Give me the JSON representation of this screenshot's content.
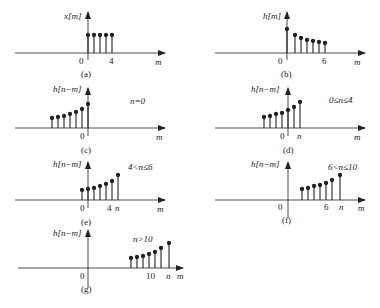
{
  "panels": [
    {
      "id": "a",
      "caption": "(a)",
      "ylabel": "x[m]",
      "xlabel": "m",
      "condition": "",
      "ticks": [
        "0",
        "4"
      ],
      "samples_m": [
        0,
        1,
        2,
        3,
        4
      ],
      "samples_val": [
        1,
        1,
        1,
        1,
        1
      ]
    },
    {
      "id": "b",
      "caption": "(b)",
      "ylabel": "h[m]",
      "xlabel": "m",
      "condition": "",
      "ticks": [
        "0",
        "6"
      ],
      "samples_m": [
        0,
        1,
        2,
        3,
        4,
        5,
        6
      ],
      "samples_val": [
        1.0,
        0.78,
        0.68,
        0.6,
        0.55,
        0.5,
        0.47
      ]
    },
    {
      "id": "c",
      "caption": "(c)",
      "ylabel": "h[n−m]",
      "xlabel": "m",
      "condition": "n=0",
      "ticks": [
        "0"
      ],
      "samples_m": [
        -6,
        -5,
        -4,
        -3,
        -2,
        -1,
        0
      ],
      "samples_val": [
        0.47,
        0.5,
        0.55,
        0.6,
        0.68,
        0.78,
        1.0
      ]
    },
    {
      "id": "d",
      "caption": "(d)",
      "ylabel": "h[n−m]",
      "xlabel": "m",
      "condition": "0≤n≤4",
      "ticks": [
        "0",
        "n"
      ],
      "samples_m": [
        -4,
        -3,
        -2,
        -1,
        0,
        1,
        2
      ],
      "samples_val": [
        0.47,
        0.5,
        0.55,
        0.6,
        0.68,
        0.78,
        1.0
      ]
    },
    {
      "id": "e",
      "caption": "(e)",
      "ylabel": "h[n−m]",
      "xlabel": "m",
      "condition": "4<n≤6",
      "ticks": [
        "0",
        "4",
        "n"
      ],
      "samples_m": [
        0,
        1,
        2,
        3,
        4,
        5,
        6
      ],
      "samples_val": [
        0.47,
        0.5,
        0.55,
        0.6,
        0.68,
        0.78,
        1.0
      ]
    },
    {
      "id": "f",
      "caption": "(f)",
      "ylabel": "h[n−m]",
      "xlabel": "m",
      "condition": "6<n≤10",
      "ticks": [
        "0",
        "6",
        "n"
      ],
      "samples_m": [
        2,
        3,
        4,
        5,
        6,
        7,
        8
      ],
      "samples_val": [
        0.47,
        0.5,
        0.55,
        0.6,
        0.68,
        0.78,
        1.0
      ]
    },
    {
      "id": "g",
      "caption": "(g)",
      "ylabel": "h[n−m]",
      "xlabel": "m",
      "condition": "n>10",
      "ticks": [
        "0",
        "10",
        "n"
      ],
      "samples_m": [
        7,
        8,
        9,
        10,
        11,
        12,
        13
      ],
      "samples_val": [
        0.47,
        0.5,
        0.55,
        0.6,
        0.68,
        0.78,
        1.0
      ]
    }
  ]
}
